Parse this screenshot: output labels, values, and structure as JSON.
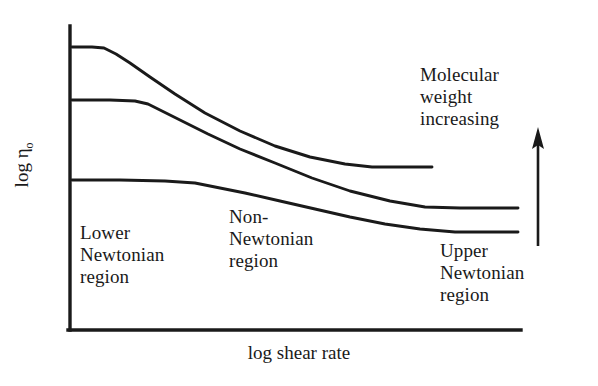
{
  "figure": {
    "background_color": "#ffffff",
    "ink_color": "#1a1a1a"
  },
  "axes": {
    "x_title": "log shear rate",
    "y_title_main": "log η",
    "y_title_subscript": "o",
    "y_title_full": "log ηo",
    "x_axis_line": {
      "x1": 70,
      "y1": 330,
      "x2": 521,
      "y2": 330
    },
    "y_axis_line": {
      "x1": 70,
      "y1": 26,
      "x2": 70,
      "y2": 330
    },
    "tick_labels_x": [],
    "tick_labels_y": [],
    "grid": false
  },
  "annotations": {
    "lower_newtonian": "Lower\nNewtonian\nregion",
    "non_newtonian": "Non-\nNewtonian\nregion",
    "upper_newtonian": "Upper\nNewtonian\nregion",
    "molecular_weight": "Molecular\nweight\nincreasing",
    "arrow": {
      "name": "molecular-weight-increasing-arrow",
      "direction": "up",
      "x": 538,
      "y_tail": 246,
      "y_head": 127
    }
  },
  "chart_data": {
    "type": "line",
    "title": "",
    "subtitle": "",
    "xlabel": "log shear rate",
    "ylabel": "log ηo",
    "xlim": [
      70,
      521
    ],
    "ylim": [
      330,
      26
    ],
    "grid": false,
    "legend": "none",
    "axis_units": "arbitrary (schematic, pixel coordinates)",
    "series": [
      {
        "name": "high molecular weight",
        "color": "#1a1a1a",
        "points": [
          [
            72,
            47
          ],
          [
            92,
            47
          ],
          [
            104,
            48
          ],
          [
            116,
            54
          ],
          [
            130,
            63
          ],
          [
            150,
            77
          ],
          [
            175,
            94
          ],
          [
            205,
            113
          ],
          [
            240,
            131
          ],
          [
            275,
            146
          ],
          [
            310,
            157
          ],
          [
            345,
            164
          ],
          [
            372,
            167
          ],
          [
            400,
            167
          ],
          [
            432,
            167
          ]
        ]
      },
      {
        "name": "medium molecular weight",
        "color": "#1a1a1a",
        "points": [
          [
            72,
            100
          ],
          [
            110,
            100
          ],
          [
            135,
            101
          ],
          [
            148,
            104
          ],
          [
            162,
            111
          ],
          [
            182,
            121
          ],
          [
            208,
            134
          ],
          [
            240,
            149
          ],
          [
            275,
            163
          ],
          [
            312,
            178
          ],
          [
            350,
            191
          ],
          [
            390,
            201
          ],
          [
            425,
            207
          ],
          [
            460,
            208
          ],
          [
            490,
            208
          ],
          [
            518,
            208
          ]
        ]
      },
      {
        "name": "low molecular weight",
        "color": "#1a1a1a",
        "points": [
          [
            72,
            180
          ],
          [
            120,
            180
          ],
          [
            165,
            181
          ],
          [
            195,
            183
          ],
          [
            215,
            187
          ],
          [
            245,
            193
          ],
          [
            280,
            201
          ],
          [
            315,
            209
          ],
          [
            350,
            217
          ],
          [
            385,
            224
          ],
          [
            420,
            229
          ],
          [
            455,
            232
          ],
          [
            485,
            232
          ],
          [
            518,
            232
          ]
        ]
      }
    ]
  }
}
